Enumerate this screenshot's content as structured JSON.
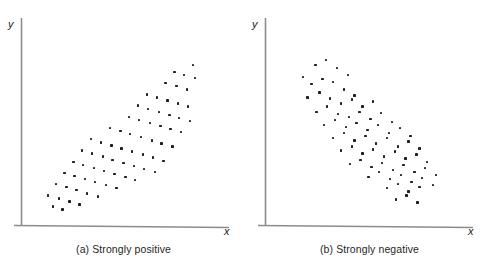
{
  "figure": {
    "background_color": "#ffffff",
    "axis_color": "#8c8c8c",
    "point_color": "#202020"
  },
  "panels": [
    {
      "id": "a",
      "caption": "(a) Strongly positive",
      "x_axis_label": "x",
      "y_axis_label": "y"
    },
    {
      "id": "b",
      "caption": "(b) Strongly negative",
      "x_axis_label": "x",
      "y_axis_label": "y"
    }
  ],
  "chart_data": [
    {
      "type": "scatter",
      "title": "(a) Strongly positive",
      "xlabel": "x",
      "ylabel": "y",
      "grid": false,
      "legend": "none",
      "axis_ticks": false,
      "xlim": [
        0,
        100
      ],
      "ylim": [
        0,
        100
      ],
      "correlation": "strongly positive",
      "series": [
        {
          "name": "observations",
          "points": [
            [
              16.0,
              9.5
            ],
            [
              21.0,
              8.0
            ],
            [
              13.5,
              15.0
            ],
            [
              19.0,
              13.5
            ],
            [
              24.5,
              12.0
            ],
            [
              29.5,
              10.5
            ],
            [
              17.5,
              20.5
            ],
            [
              23.0,
              19.0
            ],
            [
              28.0,
              17.5
            ],
            [
              33.5,
              16.0
            ],
            [
              39.0,
              14.5
            ],
            [
              22.0,
              26.0
            ],
            [
              27.0,
              24.5
            ],
            [
              32.5,
              23.0
            ],
            [
              37.5,
              21.5
            ],
            [
              43.0,
              20.0
            ],
            [
              48.5,
              18.5
            ],
            [
              26.5,
              31.5
            ],
            [
              31.5,
              30.0
            ],
            [
              37.0,
              28.5
            ],
            [
              42.0,
              27.0
            ],
            [
              47.5,
              25.5
            ],
            [
              53.0,
              24.0
            ],
            [
              58.0,
              22.5
            ],
            [
              31.0,
              37.0
            ],
            [
              36.0,
              35.5
            ],
            [
              41.5,
              34.0
            ],
            [
              46.5,
              32.5
            ],
            [
              52.0,
              31.0
            ],
            [
              57.5,
              29.5
            ],
            [
              62.5,
              28.0
            ],
            [
              68.0,
              26.5
            ],
            [
              35.5,
              42.5
            ],
            [
              40.5,
              41.0
            ],
            [
              46.0,
              39.5
            ],
            [
              51.0,
              38.0
            ],
            [
              56.5,
              36.5
            ],
            [
              62.0,
              35.0
            ],
            [
              67.0,
              33.5
            ],
            [
              72.5,
              32.0
            ],
            [
              45.0,
              48.0
            ],
            [
              50.5,
              46.5
            ],
            [
              55.5,
              45.0
            ],
            [
              61.0,
              43.5
            ],
            [
              66.5,
              42.0
            ],
            [
              71.5,
              40.5
            ],
            [
              77.0,
              39.0
            ],
            [
              55.0,
              53.5
            ],
            [
              60.0,
              52.0
            ],
            [
              65.5,
              50.5
            ],
            [
              71.0,
              49.0
            ],
            [
              76.0,
              47.5
            ],
            [
              81.5,
              46.0
            ],
            [
              59.5,
              59.0
            ],
            [
              64.5,
              57.5
            ],
            [
              70.0,
              56.0
            ],
            [
              75.5,
              54.5
            ],
            [
              80.5,
              53.0
            ],
            [
              86.0,
              51.5
            ],
            [
              64.0,
              64.5
            ],
            [
              69.0,
              63.0
            ],
            [
              74.5,
              61.5
            ],
            [
              80.0,
              60.0
            ],
            [
              85.0,
              58.5
            ],
            [
              73.5,
              70.0
            ],
            [
              79.0,
              68.5
            ],
            [
              84.5,
              67.0
            ],
            [
              78.0,
              75.5
            ],
            [
              83.0,
              74.0
            ],
            [
              88.5,
              72.5
            ],
            [
              87.5,
              79.0
            ]
          ]
        }
      ]
    },
    {
      "type": "scatter",
      "title": "(b) Strongly negative",
      "xlabel": "x",
      "ylabel": "y",
      "grid": false,
      "legend": "none",
      "axis_ticks": false,
      "xlim": [
        0,
        100
      ],
      "ylim": [
        0,
        100
      ],
      "correlation": "strongly negative",
      "series": [
        {
          "name": "observations",
          "points": [
            [
              19.0,
              73.0
            ],
            [
              25.5,
              79.0
            ],
            [
              31.0,
              81.5
            ],
            [
              36.5,
              77.5
            ],
            [
              42.0,
              74.0
            ],
            [
              23.5,
              69.5
            ],
            [
              29.0,
              72.0
            ],
            [
              34.5,
              70.5
            ],
            [
              40.0,
              67.0
            ],
            [
              45.5,
              64.0
            ],
            [
              21.5,
              63.0
            ],
            [
              27.5,
              65.5
            ],
            [
              33.0,
              62.5
            ],
            [
              38.5,
              60.0
            ],
            [
              44.0,
              62.0
            ],
            [
              49.5,
              58.5
            ],
            [
              55.0,
              61.0
            ],
            [
              26.0,
              56.0
            ],
            [
              31.5,
              58.5
            ],
            [
              37.0,
              55.0
            ],
            [
              42.5,
              53.5
            ],
            [
              48.0,
              56.0
            ],
            [
              53.5,
              52.5
            ],
            [
              59.0,
              55.5
            ],
            [
              64.5,
              51.0
            ],
            [
              30.0,
              49.5
            ],
            [
              35.5,
              52.0
            ],
            [
              41.0,
              48.5
            ],
            [
              46.5,
              50.5
            ],
            [
              52.0,
              47.0
            ],
            [
              57.5,
              49.5
            ],
            [
              63.0,
              45.5
            ],
            [
              68.5,
              48.0
            ],
            [
              74.0,
              44.0
            ],
            [
              34.5,
              43.0
            ],
            [
              40.0,
              45.5
            ],
            [
              45.5,
              42.0
            ],
            [
              51.0,
              44.0
            ],
            [
              56.5,
              40.5
            ],
            [
              62.0,
              43.0
            ],
            [
              67.5,
              39.0
            ],
            [
              73.0,
              41.5
            ],
            [
              78.5,
              38.0
            ],
            [
              38.5,
              37.0
            ],
            [
              44.0,
              39.0
            ],
            [
              49.5,
              35.5
            ],
            [
              55.0,
              37.5
            ],
            [
              60.5,
              34.0
            ],
            [
              66.0,
              36.5
            ],
            [
              71.5,
              33.0
            ],
            [
              77.0,
              35.0
            ],
            [
              82.5,
              31.5
            ],
            [
              43.0,
              30.5
            ],
            [
              48.5,
              32.5
            ],
            [
              54.0,
              29.0
            ],
            [
              59.5,
              31.0
            ],
            [
              65.0,
              27.5
            ],
            [
              70.5,
              30.0
            ],
            [
              76.0,
              26.5
            ],
            [
              81.5,
              28.5
            ],
            [
              87.0,
              25.0
            ],
            [
              52.5,
              24.0
            ],
            [
              58.0,
              26.5
            ],
            [
              63.5,
              23.0
            ],
            [
              69.0,
              25.0
            ],
            [
              74.5,
              21.5
            ],
            [
              80.0,
              23.5
            ],
            [
              85.5,
              20.0
            ],
            [
              62.0,
              18.5
            ],
            [
              67.5,
              20.5
            ],
            [
              73.0,
              17.0
            ],
            [
              78.5,
              19.0
            ],
            [
              66.5,
              13.0
            ],
            [
              72.0,
              15.0
            ],
            [
              77.5,
              11.5
            ]
          ]
        }
      ]
    }
  ]
}
